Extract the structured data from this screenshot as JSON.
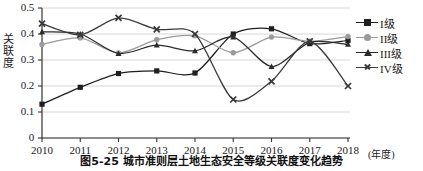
{
  "chart_data": {
    "type": "line",
    "title": "",
    "caption": "图5-25  城市准则层土地生态安全等级关联度变化趋势",
    "xlabel": "(年度)",
    "ylabel": "关联度",
    "categories": [
      "2010",
      "2011",
      "2012",
      "2013",
      "2014",
      "2015",
      "2016",
      "2017",
      "2018"
    ],
    "x": [
      2010,
      2011,
      2012,
      2013,
      2014,
      2015,
      2016,
      2017,
      2018
    ],
    "ylim": [
      0,
      0.5
    ],
    "yticks": [
      0,
      0.1,
      0.2,
      0.3,
      0.4,
      0.5
    ],
    "ytick_labels": [
      "0",
      "0.1",
      "0.2",
      "0.3",
      "0.4",
      "0.5"
    ],
    "grid": "horizontal",
    "legend_position": "right",
    "series": [
      {
        "name": "I级",
        "marker": "square",
        "color": "#1e1e1e",
        "values": [
          0.13,
          0.195,
          0.248,
          0.258,
          0.25,
          0.4,
          0.42,
          0.363,
          0.375
        ]
      },
      {
        "name": "II级",
        "marker": "circle",
        "color": "#9a9a9a",
        "values": [
          0.36,
          0.385,
          0.327,
          0.378,
          0.393,
          0.328,
          0.388,
          0.372,
          0.39
        ]
      },
      {
        "name": "III级",
        "marker": "triangle",
        "color": "#2b2b2b",
        "values": [
          0.408,
          0.4,
          0.325,
          0.357,
          0.335,
          0.388,
          0.275,
          0.368,
          0.36
        ]
      },
      {
        "name": "IV级",
        "marker": "cross",
        "color": "#3a3a3a",
        "values": [
          0.44,
          0.397,
          0.462,
          0.418,
          0.4,
          0.148,
          0.218,
          0.372,
          0.2
        ]
      }
    ]
  },
  "legend": {
    "items": [
      {
        "label": "I级"
      },
      {
        "label": "II级"
      },
      {
        "label": "III级"
      },
      {
        "label": "IV级"
      }
    ]
  },
  "axes": {
    "y_title_chars": [
      "关",
      "联",
      "度"
    ],
    "x_unit": "(年度)"
  }
}
